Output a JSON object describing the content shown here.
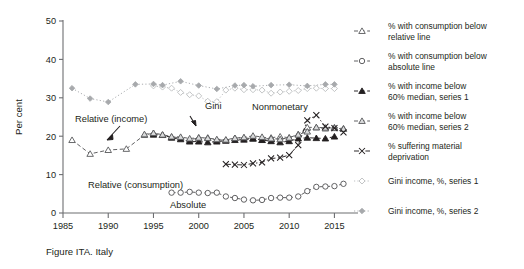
{
  "figure": {
    "caption": "Figure ITA. Italy",
    "ylabel": "Per cent",
    "ylim": [
      0,
      50
    ],
    "yticks": [
      "0",
      "10",
      "20",
      "30",
      "40",
      "50"
    ],
    "xlim": [
      1985,
      2016.5
    ],
    "xticks": [
      "1985",
      "1990",
      "1995",
      "2000",
      "2005",
      "2010",
      "2015"
    ]
  },
  "annotations": [
    {
      "text": "Gini",
      "x": 205,
      "y": 109
    },
    {
      "text": "Nonmonetary",
      "x": 252,
      "y": 110
    },
    {
      "text": "Relative (income)",
      "x": 75,
      "y": 122
    },
    {
      "text": "Relative (consumption)",
      "x": 88,
      "y": 188
    },
    {
      "text": "Absolute",
      "x": 170,
      "y": 208
    }
  ],
  "legend": {
    "items": [
      {
        "label": "% with consumption below relative line",
        "marker": "open-triangle",
        "dash": "solid",
        "color": "#58595b"
      },
      {
        "label": "% with consumption below absolute line",
        "marker": "open-circle",
        "dash": "solid",
        "color": "#58595b"
      },
      {
        "label": "% with income below 60% median, series 1",
        "marker": "filled-triangle",
        "dash": "solid",
        "color": "#231f20"
      },
      {
        "label": "% with income below 60% median, series 2",
        "marker": "shaded-triangle",
        "dash": "solid",
        "color": "#58595b"
      },
      {
        "label": "% suffering material deprivation",
        "marker": "cross",
        "dash": "dashdot",
        "color": "#231f20"
      },
      {
        "label": "Gini income, %, series 1",
        "marker": "open-diamond",
        "dash": "dotted",
        "color": "#bcbec0"
      },
      {
        "label": "Gini income, %, series 2",
        "marker": "filled-diamond",
        "dash": "dotted",
        "color": "#a7a9ac"
      }
    ]
  },
  "chart_data": {
    "type": "line",
    "title": "Figure ITA. Italy",
    "xlabel": "",
    "ylabel": "Per cent",
    "ylim": [
      0,
      50
    ],
    "xlim": [
      1985,
      2016.5
    ],
    "grid": false,
    "legend_position": "right",
    "series": [
      {
        "name": "% with consumption below relative line",
        "marker": "open-triangle",
        "color": "#58595b",
        "points": [
          [
            1986,
            19.0
          ],
          [
            1988,
            15.4
          ],
          [
            1990,
            16.4
          ],
          [
            1992,
            16.7
          ],
          [
            1994,
            20.3
          ],
          [
            1995,
            20.8
          ],
          [
            1996,
            20.3
          ],
          [
            1997,
            19.8
          ],
          [
            1998,
            19.6
          ],
          [
            1999,
            19.0
          ],
          [
            2000,
            19.6
          ],
          [
            2001,
            19.6
          ],
          [
            2002,
            19.0
          ],
          [
            2003,
            19.0
          ],
          [
            2004,
            19.5
          ],
          [
            2005,
            19.6
          ],
          [
            2006,
            19.3
          ],
          [
            2007,
            19.0
          ],
          [
            2008,
            19.6
          ],
          [
            2009,
            19.9
          ],
          [
            2010,
            19.6
          ],
          [
            2011,
            20.5
          ],
          [
            2012,
            22.3
          ],
          [
            2013,
            22.3
          ],
          [
            2014,
            22.0
          ],
          [
            2015,
            22.3
          ],
          [
            2016,
            22.0
          ]
        ]
      },
      {
        "name": "% with consumption below absolute line",
        "marker": "open-circle",
        "color": "#58595b",
        "points": [
          [
            1997,
            5.3
          ],
          [
            1998,
            5.3
          ],
          [
            1999,
            5.5
          ],
          [
            2000,
            5.3
          ],
          [
            2001,
            5.2
          ],
          [
            2002,
            5.3
          ],
          [
            2003,
            4.3
          ],
          [
            2004,
            3.9
          ],
          [
            2005,
            3.5
          ],
          [
            2006,
            3.3
          ],
          [
            2007,
            3.4
          ],
          [
            2008,
            3.9
          ],
          [
            2009,
            4.0
          ],
          [
            2010,
            4.0
          ],
          [
            2011,
            4.3
          ],
          [
            2012,
            5.7
          ],
          [
            2013,
            6.8
          ],
          [
            2014,
            6.9
          ],
          [
            2015,
            7.0
          ],
          [
            2016,
            7.6
          ]
        ]
      },
      {
        "name": "% with income below 60% median, series 1",
        "marker": "filled-triangle",
        "color": "#231f20",
        "points": [
          [
            1995,
            20.4
          ],
          [
            1996,
            20.3
          ],
          [
            1997,
            19.6
          ],
          [
            1998,
            19.2
          ],
          [
            1999,
            18.6
          ],
          [
            2000,
            18.6
          ],
          [
            2001,
            18.4
          ],
          [
            2002,
            18.6
          ],
          [
            2003,
            18.8
          ],
          [
            2004,
            19.0
          ],
          [
            2005,
            19.1
          ],
          [
            2006,
            19.4
          ],
          [
            2007,
            19.0
          ],
          [
            2008,
            18.7
          ],
          [
            2009,
            18.4
          ],
          [
            2010,
            18.7
          ],
          [
            2011,
            19.4
          ],
          [
            2012,
            19.6
          ],
          [
            2013,
            19.5
          ],
          [
            2014,
            19.4
          ],
          [
            2015,
            19.9
          ]
        ]
      },
      {
        "name": "% with income below 60% median, series 2",
        "marker": "shaded-triangle",
        "color": "#58595b",
        "points": [
          [
            1994,
            20.5
          ],
          [
            1995,
            20.8
          ],
          [
            1996,
            20.4
          ],
          [
            1997,
            19.9
          ],
          [
            1998,
            19.8
          ],
          [
            1999,
            19.4
          ],
          [
            2000,
            19.6
          ],
          [
            2001,
            19.5
          ],
          [
            2002,
            19.2
          ],
          [
            2003,
            19.1
          ],
          [
            2004,
            19.5
          ],
          [
            2005,
            19.7
          ],
          [
            2006,
            20.1
          ],
          [
            2007,
            19.8
          ],
          [
            2008,
            19.4
          ],
          [
            2009,
            19.2
          ],
          [
            2010,
            19.6
          ],
          [
            2011,
            20.4
          ],
          [
            2012,
            21.2
          ],
          [
            2013,
            22.3
          ],
          [
            2014,
            22.2
          ],
          [
            2015,
            22.1
          ],
          [
            2016,
            21.9
          ]
        ]
      },
      {
        "name": "% suffering material deprivation",
        "marker": "cross",
        "color": "#231f20",
        "points": [
          [
            2003,
            12.7
          ],
          [
            2004,
            12.6
          ],
          [
            2005,
            12.5
          ],
          [
            2006,
            12.9
          ],
          [
            2007,
            13.2
          ],
          [
            2008,
            14.2
          ],
          [
            2009,
            14.4
          ],
          [
            2010,
            15.1
          ],
          [
            2011,
            17.7
          ],
          [
            2012,
            24.1
          ],
          [
            2013,
            25.5
          ],
          [
            2014,
            22.5
          ],
          [
            2015,
            22.1
          ],
          [
            2016,
            21.0
          ]
        ]
      },
      {
        "name": "Gini income, %, series 1",
        "marker": "open-diamond",
        "color": "#bcbec0",
        "points": [
          [
            1995,
            33.1
          ],
          [
            1996,
            32.8
          ],
          [
            1997,
            32.5
          ],
          [
            1998,
            31.4
          ],
          [
            1999,
            30.8
          ],
          [
            2000,
            30.5
          ],
          [
            2001,
            29.1
          ],
          [
            2002,
            29.0
          ],
          [
            2003,
            32.0
          ],
          [
            2004,
            32.5
          ],
          [
            2005,
            32.1
          ],
          [
            2006,
            32.1
          ],
          [
            2007,
            32.0
          ],
          [
            2008,
            31.2
          ],
          [
            2009,
            31.5
          ],
          [
            2010,
            31.7
          ],
          [
            2011,
            31.9
          ],
          [
            2012,
            32.4
          ],
          [
            2013,
            32.5
          ],
          [
            2014,
            32.4
          ],
          [
            2015,
            32.4
          ]
        ]
      },
      {
        "name": "Gini income, %, series 2",
        "marker": "filled-diamond",
        "color": "#a7a9ac",
        "points": [
          [
            1986,
            32.5
          ],
          [
            1988,
            29.8
          ],
          [
            1990,
            28.9
          ],
          [
            1993,
            33.5
          ],
          [
            1995,
            33.6
          ],
          [
            1996,
            33.3
          ],
          [
            1998,
            34.3
          ],
          [
            2000,
            33.2
          ],
          [
            2002,
            32.3
          ],
          [
            2004,
            33.2
          ],
          [
            2005,
            33.3
          ],
          [
            2006,
            33.0
          ],
          [
            2008,
            33.3
          ],
          [
            2010,
            33.4
          ],
          [
            2012,
            33.1
          ],
          [
            2014,
            33.5
          ],
          [
            2015,
            33.5
          ]
        ]
      }
    ]
  }
}
